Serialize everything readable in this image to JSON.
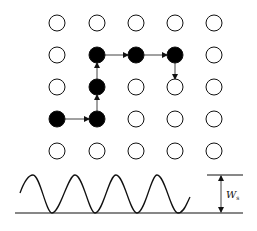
{
  "diagram": {
    "grid": {
      "cols": [
        57,
        97,
        136,
        175,
        214
      ],
      "rows": [
        23,
        55,
        87,
        119,
        151
      ],
      "radius": 8,
      "filled": [
        [
          1,
          1
        ],
        [
          2,
          1
        ],
        [
          3,
          1
        ],
        [
          1,
          2
        ],
        [
          0,
          3
        ],
        [
          1,
          3
        ]
      ],
      "path": [
        [
          0,
          3
        ],
        [
          1,
          3
        ],
        [
          1,
          2
        ],
        [
          1,
          1
        ],
        [
          2,
          1
        ],
        [
          3,
          1
        ],
        [
          3,
          2
        ]
      ]
    },
    "wave": {
      "baseline_y": 213,
      "peak_y": 175,
      "label_main": "W",
      "label_sub": "s"
    },
    "colors": {
      "stroke": "#111111",
      "fill": "#000000",
      "background": "#ffffff"
    }
  }
}
